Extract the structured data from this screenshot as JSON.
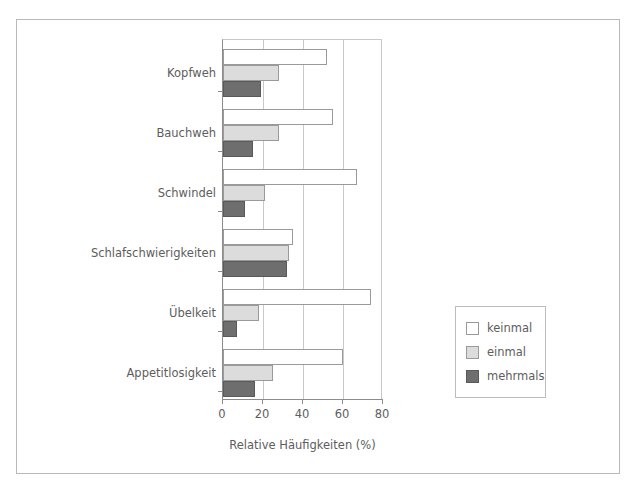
{
  "chart_data": {
    "type": "bar",
    "orientation": "horizontal",
    "title": "",
    "xlabel": "Relative Häufigkeiten (%)",
    "ylabel": "",
    "xlim": [
      0,
      80
    ],
    "xticks": [
      0,
      20,
      40,
      60,
      80
    ],
    "xticklabels": [
      "0",
      "20",
      "40",
      "60",
      "80"
    ],
    "grid": true,
    "legend_position": "right",
    "categories": [
      "Kopfweh",
      "Bauchweh",
      "Schwindel",
      "Schlafschwierigkeiten",
      "Übelkeit",
      "Appetitlosigkeit"
    ],
    "series": [
      {
        "name": "keinmal",
        "color": "#ffffff",
        "values": [
          52,
          55,
          67,
          35,
          74,
          60
        ]
      },
      {
        "name": "einmal",
        "color": "#dcdcdc",
        "values": [
          28,
          28,
          21,
          33,
          18,
          25
        ]
      },
      {
        "name": "mehrmals",
        "color": "#6e6e6e",
        "values": [
          19,
          15,
          11,
          32,
          7,
          16
        ]
      }
    ]
  },
  "legend": {
    "items": [
      {
        "label": "keinmal"
      },
      {
        "label": "einmal"
      },
      {
        "label": "mehrmals"
      }
    ]
  },
  "axis": {
    "x_title": "Relative Häufigkeiten (%)",
    "ticks": [
      "0",
      "20",
      "40",
      "60",
      "80"
    ]
  }
}
